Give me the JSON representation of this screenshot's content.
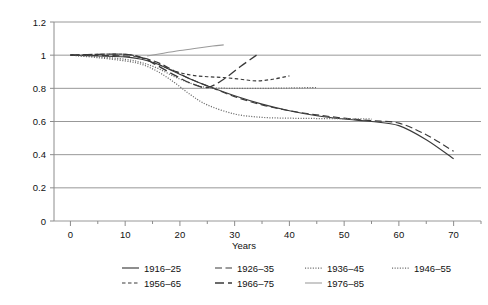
{
  "chart_data": {
    "type": "line",
    "title": "",
    "xlabel": "Years",
    "ylabel": "",
    "xlim": [
      -3,
      75
    ],
    "ylim": [
      0,
      1.2
    ],
    "grid": "horizontal",
    "legend_position": "bottom",
    "xticks": [
      0,
      10,
      20,
      30,
      40,
      50,
      60,
      70
    ],
    "xtick_labels": [
      "0",
      "10",
      "20",
      "30",
      "40",
      "50",
      "60",
      "70"
    ],
    "yticks": [
      0,
      0.2,
      0.4,
      0.6,
      0.8,
      1,
      1.2
    ],
    "ytick_labels": [
      "0",
      "0.2",
      "0.4",
      "0.6",
      "0.8",
      "1",
      "1.2"
    ],
    "series": [
      {
        "name": "1916–25",
        "style": "solid",
        "color": "#3a3a3a",
        "x": [
          0,
          5,
          10,
          13,
          16,
          19,
          22,
          25,
          30,
          35,
          40,
          45,
          50,
          55,
          60,
          65,
          70
        ],
        "values": [
          1.0,
          0.995,
          0.99,
          0.975,
          0.945,
          0.9,
          0.855,
          0.815,
          0.755,
          0.705,
          0.665,
          0.635,
          0.615,
          0.6,
          0.575,
          0.49,
          0.375
        ]
      },
      {
        "name": "1926–35",
        "style": "dashed",
        "color": "#3a3a3a",
        "x": [
          0,
          5,
          10,
          13,
          16,
          19,
          22,
          25,
          30,
          35,
          40,
          45,
          50,
          55,
          60,
          65,
          70
        ],
        "values": [
          1.0,
          0.998,
          0.995,
          0.985,
          0.955,
          0.905,
          0.855,
          0.815,
          0.75,
          0.7,
          0.665,
          0.64,
          0.62,
          0.605,
          0.59,
          0.52,
          0.42
        ]
      },
      {
        "name": "1936–45",
        "style": "dotted",
        "color": "#6b6b6b",
        "x": [
          0,
          5,
          10,
          13,
          16,
          19,
          22,
          25,
          30,
          35,
          40,
          45,
          50,
          55
        ],
        "values": [
          1.0,
          0.985,
          0.965,
          0.945,
          0.9,
          0.835,
          0.76,
          0.7,
          0.645,
          0.625,
          0.62,
          0.618,
          0.617,
          0.615
        ]
      },
      {
        "name": "1946–55",
        "style": "dotted",
        "color": "#6b6b6b",
        "x": [
          0,
          5,
          10,
          13,
          16,
          19,
          22,
          25,
          30,
          35,
          40,
          45
        ],
        "values": [
          1.0,
          0.99,
          0.975,
          0.955,
          0.92,
          0.87,
          0.83,
          0.805,
          0.8,
          0.8,
          0.802,
          0.805
        ]
      },
      {
        "name": "1956–65",
        "style": "shortdash",
        "color": "#3a3a3a",
        "x": [
          0,
          5,
          10,
          13,
          16,
          19,
          22,
          25,
          28,
          31,
          34,
          37,
          40
        ],
        "values": [
          1.0,
          1.005,
          1.005,
          0.985,
          0.945,
          0.905,
          0.88,
          0.87,
          0.865,
          0.855,
          0.845,
          0.855,
          0.875
        ]
      },
      {
        "name": "1966–75",
        "style": "longdash",
        "color": "#3a3a3a",
        "x": [
          0,
          5,
          10,
          13,
          16,
          19,
          22,
          25,
          28,
          31,
          34
        ],
        "values": [
          1.0,
          1.005,
          1.005,
          0.985,
          0.935,
          0.88,
          0.83,
          0.805,
          0.855,
          0.93,
          1.0
        ]
      },
      {
        "name": "1976–85",
        "style": "solid-light",
        "color": "#9a9a9a",
        "x": [
          14,
          17,
          20,
          23,
          26,
          28
        ],
        "values": [
          0.995,
          1.012,
          1.028,
          1.042,
          1.055,
          1.062
        ]
      }
    ],
    "legend_rows": [
      [
        "1916–25",
        "1926–35",
        "1936–45",
        "1946–55"
      ],
      [
        "1956–65",
        "1966–75",
        "1976–85"
      ]
    ]
  }
}
